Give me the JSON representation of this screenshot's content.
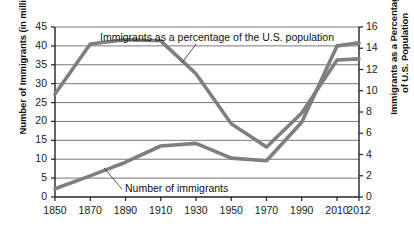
{
  "chart_data": {
    "type": "line",
    "title": "",
    "xlabel": "",
    "grid": "horizontal",
    "legend_position": "inline-annotations",
    "x": [
      1850,
      1870,
      1890,
      1910,
      1930,
      1950,
      1970,
      1990,
      2010,
      2012
    ],
    "x_tick_labels": [
      "1850",
      "1870",
      "1890",
      "1910",
      "1930",
      "1950",
      "1970",
      "1990",
      "2010",
      "2012"
    ],
    "axes": {
      "left": {
        "label": "Number of Immigrants (in millions)",
        "ticks": [
          0,
          5,
          10,
          15,
          20,
          25,
          30,
          35,
          40,
          45
        ],
        "tick_labels": [
          "0",
          "5",
          "10",
          "15",
          "20",
          "25",
          "30",
          "35",
          "40",
          "45"
        ],
        "ylim": [
          0,
          45
        ]
      },
      "right": {
        "label": "Immigrants as a Percentage of U.S. Population",
        "label_line1": "Immigrants as a Percentage",
        "label_line2": "of U.S. Population",
        "ticks": [
          0,
          2,
          4,
          6,
          8,
          10,
          12,
          14,
          16
        ],
        "tick_labels": [
          "0",
          "2",
          "4",
          "6",
          "8",
          "10",
          "12",
          "14",
          "16"
        ],
        "ylim": [
          0,
          16
        ]
      }
    },
    "series": [
      {
        "name": "Immigrants as a percentage of the U.S. population",
        "axis": "right",
        "color": "#7f7f7f",
        "values": [
          9.7,
          14.4,
          14.8,
          14.7,
          11.6,
          6.9,
          4.7,
          7.9,
          12.9,
          13.0
        ]
      },
      {
        "name": "Number of immigrants",
        "axis": "left",
        "color": "#7f7f7f",
        "values": [
          2.2,
          5.6,
          9.2,
          13.5,
          14.2,
          10.3,
          9.6,
          19.8,
          40.0,
          40.8
        ]
      }
    ],
    "annotations": [
      {
        "name": "percentage-annotation",
        "text": "Immigrants as a percentage of the U.S. population"
      },
      {
        "name": "number-annotation",
        "text": "Number of immigrants"
      }
    ],
    "colors": {
      "line": "#7f7f7f",
      "grid": "#555555",
      "axis": "#222222",
      "text": "#111111",
      "background": "#ffffff"
    }
  }
}
